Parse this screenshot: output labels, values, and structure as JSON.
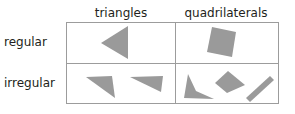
{
  "columns": [
    {
      "label": "triangles"
    },
    {
      "label": "quadrilaterals"
    }
  ],
  "rows": [
    {
      "label": "regular"
    },
    {
      "label": "irregular"
    }
  ],
  "cells": {
    "regular_triangles": {
      "shapes": [
        "equilateral-triangle"
      ]
    },
    "regular_quadrilaterals": {
      "shapes": [
        "square"
      ]
    },
    "irregular_triangles": {
      "shapes": [
        "scalene-triangle",
        "scalene-triangle"
      ]
    },
    "irregular_quadrilaterals": {
      "shapes": [
        "irregular-quadrilateral",
        "kite",
        "thin-rectangle"
      ]
    }
  },
  "colors": {
    "shape_fill": "#9a9a9a",
    "grid_line": "#9c9c9c",
    "text": "#231f20"
  }
}
